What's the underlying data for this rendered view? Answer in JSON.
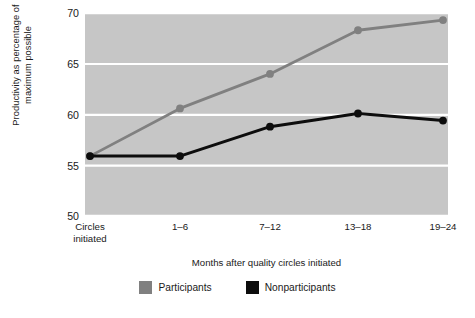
{
  "chart_data": {
    "type": "line",
    "title": "",
    "subtitle": "",
    "xlabel": "Months after quality circles initiated",
    "ylabel": "Productivity as percentage of\nmaximum possible",
    "categories": [
      "Circles\ninitiated",
      "1–6",
      "7–12",
      "13–18",
      "19–24"
    ],
    "x_tick_labels": [
      "Circles\ninitiated",
      "1–6",
      "7–12",
      "13–18",
      "19–24"
    ],
    "y_tick_labels": [
      "70",
      "65",
      "60",
      "55",
      "50"
    ],
    "y_ticks": [
      70,
      65,
      60,
      55,
      50
    ],
    "ylim": [
      50,
      70
    ],
    "grid": "horizontal",
    "grid_color": "#ffffff",
    "plot_background": "#c6c6c6",
    "legend_position": "bottom-center",
    "series": [
      {
        "name": "Participants",
        "color": "#808080",
        "marker": "circle",
        "values": [
          55.9,
          60.6,
          64.0,
          68.3,
          69.3
        ]
      },
      {
        "name": "Nonparticipants",
        "color": "#0d0d0d",
        "marker": "circle",
        "values": [
          55.9,
          55.9,
          58.8,
          60.1,
          59.4
        ]
      }
    ]
  },
  "legend": {
    "items": [
      {
        "label": "Participants",
        "color": "#808080"
      },
      {
        "label": "Nonparticipants",
        "color": "#0d0d0d"
      }
    ]
  }
}
